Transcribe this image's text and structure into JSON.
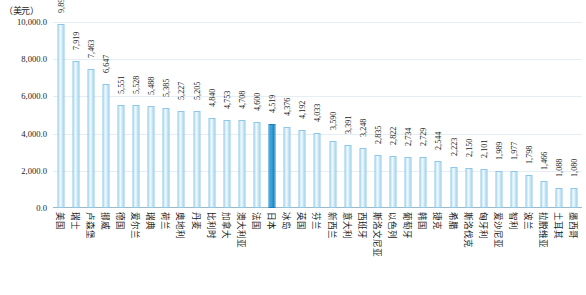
{
  "chart_data": {
    "type": "bar",
    "title": "",
    "subtitle": "",
    "unit_label": "（美元）",
    "xlabel": "",
    "ylabel": "",
    "ylim": [
      0,
      10000
    ],
    "ytick_values": [
      0,
      2000,
      4000,
      6000,
      8000,
      10000
    ],
    "ytick_labels": [
      "0.0",
      "2,000.0",
      "4,000.0",
      "6,000.0",
      "8,000.0",
      "10,000.0"
    ],
    "grid": true,
    "legend": "none",
    "highlight_category": "日本",
    "colors": {
      "bar": "#bfe3f5",
      "bar_edge": "#8dc8e6",
      "bar_highlight": "#2e9ad6",
      "gridline": "#e4eef4",
      "axis": "#9fb8c6",
      "text": "#1a1a1a"
    },
    "categories": [
      "美国",
      "瑞士",
      "卢森堡",
      "挪威",
      "德国",
      "爱尔兰",
      "瑞典",
      "荷兰",
      "奥地利",
      "丹麦",
      "比利时",
      "加拿大",
      "澳大利亚",
      "法国",
      "日本",
      "冰岛",
      "英国",
      "芬兰",
      "新西兰",
      "意大利",
      "西班牙",
      "斯洛文尼亚",
      "以色列",
      "葡萄牙",
      "韩国",
      "捷克",
      "希腊",
      "斯洛伐克",
      "匈牙利",
      "爱沙尼亚",
      "智利",
      "波兰",
      "拉脱维亚",
      "土耳其",
      "墨西哥"
    ],
    "values": [
      9892,
      7919,
      7463,
      6647,
      5551,
      5528,
      5488,
      5385,
      5227,
      5205,
      4840,
      4753,
      4708,
      4600,
      4519,
      4376,
      4192,
      4033,
      3590,
      3391,
      3248,
      2835,
      2822,
      2734,
      2729,
      2544,
      2223,
      2150,
      2101,
      1989,
      1977,
      1798,
      1466,
      1088,
      1080
    ],
    "value_labels": [
      "9,892",
      "7,919",
      "7,463",
      "6,647",
      "5,551",
      "5,528",
      "5,488",
      "5,385",
      "5,227",
      "5,205",
      "4,840",
      "4,753",
      "4,708",
      "4,600",
      "4,519",
      "4,376",
      "4,192",
      "4,033",
      "3,590",
      "3,391",
      "3,248",
      "2,835",
      "2,822",
      "2,734",
      "2,729",
      "2,544",
      "2,223",
      "2,150",
      "2,101",
      "1,989",
      "1,977",
      "1,798",
      "1,466",
      "1,088",
      "1,080"
    ]
  }
}
